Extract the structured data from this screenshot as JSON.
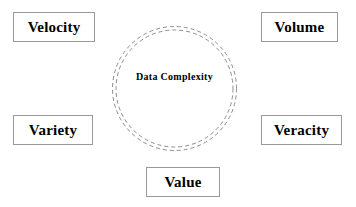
{
  "diagram": {
    "title": "Data Complexity",
    "background_color": "#ffffff",
    "core": {
      "label": "Data Complexity",
      "shape": "double-dashed-circle",
      "stroke_color": "#8c8c8c",
      "fill_color": "#ffffff",
      "center_x": 174,
      "center_y": 88,
      "outer_radius": 62,
      "inner_radius": 59,
      "dash_pattern": "4 3"
    },
    "boxes": [
      {
        "id": "velocity",
        "label": "Velocity",
        "position": "top-left",
        "border_color": "#9a9a9a",
        "fill_color": "#ffffff",
        "text_color": "#000000"
      },
      {
        "id": "volume",
        "label": "Volume",
        "position": "top-right",
        "border_color": "#9a9a9a",
        "fill_color": "#ffffff",
        "text_color": "#000000"
      },
      {
        "id": "variety",
        "label": "Variety",
        "position": "bottom-left",
        "border_color": "#9a9a9a",
        "fill_color": "#ffffff",
        "text_color": "#000000"
      },
      {
        "id": "veracity",
        "label": "Veracity",
        "position": "bottom-right",
        "border_color": "#9a9a9a",
        "fill_color": "#ffffff",
        "text_color": "#000000"
      },
      {
        "id": "value",
        "label": "Value",
        "position": "bottom-center",
        "border_color": "#9a9a9a",
        "fill_color": "#ffffff",
        "text_color": "#000000"
      }
    ]
  }
}
